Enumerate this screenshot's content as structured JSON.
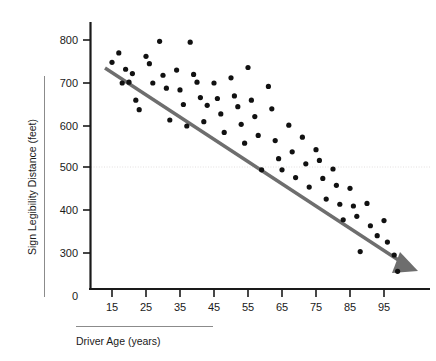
{
  "chart_data": {
    "type": "scatter",
    "title": "",
    "xlabel": "Driver Age (years)",
    "ylabel": "Sign Legibility Distance (feet)",
    "xlim": [
      8,
      103
    ],
    "ylim": [
      215,
      830
    ],
    "xticks": [
      15,
      25,
      35,
      45,
      55,
      65,
      75,
      85,
      95
    ],
    "yticks": [
      0,
      300,
      400,
      500,
      600,
      700,
      800
    ],
    "grid": "single dotted horizontal gridline at y = 500",
    "legend": "none",
    "annotations": [
      {
        "name": "trend-arrow",
        "description": "thick gray downward-sloping arrow through the cloud",
        "from": [
          16,
          735
        ],
        "to": [
          100,
          248
        ]
      }
    ],
    "series": [
      {
        "name": "Drivers",
        "marker": "filled black circle",
        "color": "#111111",
        "points": [
          [
            15,
            748
          ],
          [
            17,
            770
          ],
          [
            18,
            700
          ],
          [
            19,
            732
          ],
          [
            20,
            702
          ],
          [
            21,
            722
          ],
          [
            22,
            660
          ],
          [
            23,
            638
          ],
          [
            25,
            762
          ],
          [
            26,
            745
          ],
          [
            27,
            700
          ],
          [
            29,
            797
          ],
          [
            30,
            718
          ],
          [
            31,
            688
          ],
          [
            32,
            614
          ],
          [
            34,
            730
          ],
          [
            35,
            684
          ],
          [
            36,
            650
          ],
          [
            37,
            600
          ],
          [
            38,
            795
          ],
          [
            39,
            720
          ],
          [
            40,
            702
          ],
          [
            41,
            666
          ],
          [
            42,
            610
          ],
          [
            43,
            648
          ],
          [
            45,
            700
          ],
          [
            46,
            664
          ],
          [
            47,
            628
          ],
          [
            48,
            585
          ],
          [
            50,
            712
          ],
          [
            51,
            670
          ],
          [
            52,
            645
          ],
          [
            53,
            604
          ],
          [
            54,
            560
          ],
          [
            55,
            736
          ],
          [
            56,
            660
          ],
          [
            57,
            622
          ],
          [
            58,
            578
          ],
          [
            59,
            498
          ],
          [
            61,
            692
          ],
          [
            62,
            640
          ],
          [
            63,
            566
          ],
          [
            64,
            524
          ],
          [
            65,
            498
          ],
          [
            67,
            602
          ],
          [
            68,
            540
          ],
          [
            69,
            480
          ],
          [
            71,
            574
          ],
          [
            72,
            512
          ],
          [
            73,
            458
          ],
          [
            75,
            545
          ],
          [
            76,
            520
          ],
          [
            77,
            478
          ],
          [
            78,
            430
          ],
          [
            80,
            500
          ],
          [
            81,
            462
          ],
          [
            82,
            418
          ],
          [
            83,
            382
          ],
          [
            85,
            455
          ],
          [
            86,
            414
          ],
          [
            87,
            390
          ],
          [
            88,
            308
          ],
          [
            90,
            420
          ],
          [
            91,
            368
          ],
          [
            93,
            345
          ],
          [
            95,
            380
          ],
          [
            96,
            330
          ],
          [
            98,
            300
          ],
          [
            99,
            262
          ]
        ]
      }
    ]
  },
  "axes": {
    "y_tick_labels": [
      "800",
      "700",
      "600",
      "500",
      "400",
      "300",
      "0"
    ],
    "x_tick_labels": [
      "15",
      "25",
      "35",
      "45",
      "55",
      "65",
      "75",
      "85",
      "95"
    ],
    "y_axis_title": "Sign Legibility Distance (feet)",
    "x_axis_title": "Driver Age (years)"
  },
  "colors": {
    "point": "#111111",
    "trendline": "#6e6e6e",
    "axis": "#1a1a1a",
    "gridline": "#e2dede",
    "rule": "#8b8b8b",
    "background": "#ffffff"
  }
}
